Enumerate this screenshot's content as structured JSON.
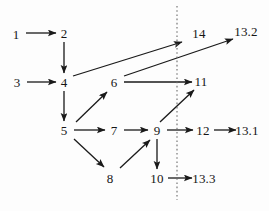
{
  "diagram": {
    "type": "directed-graph",
    "title": "",
    "canvas": {
      "width": 269,
      "height": 211,
      "background": "#fdfdfd"
    },
    "style": {
      "edge_color": "#1a1a1a",
      "edge_width": 1.3,
      "label_color": "#151515",
      "label_font_size": 13,
      "divider_color": "#6b6b6b"
    },
    "divider": {
      "name": "vertical-dotted-divider",
      "orientation": "vertical",
      "x": 177,
      "y1": 6,
      "y2": 200,
      "dash": "1.6,2.6"
    },
    "nodes": [
      {
        "id": "1",
        "label": "1",
        "x": 16,
        "y": 34
      },
      {
        "id": "2",
        "label": "2",
        "x": 64,
        "y": 33
      },
      {
        "id": "3",
        "label": "3",
        "x": 17,
        "y": 82
      },
      {
        "id": "4",
        "label": "4",
        "x": 64,
        "y": 82
      },
      {
        "id": "5",
        "label": "5",
        "x": 64,
        "y": 130
      },
      {
        "id": "6",
        "label": "6",
        "x": 114,
        "y": 82
      },
      {
        "id": "7",
        "label": "7",
        "x": 114,
        "y": 130
      },
      {
        "id": "8",
        "label": "8",
        "x": 110,
        "y": 178
      },
      {
        "id": "9",
        "label": "9",
        "x": 157,
        "y": 130
      },
      {
        "id": "10",
        "label": "10",
        "x": 157,
        "y": 178
      },
      {
        "id": "11",
        "label": "11",
        "x": 201,
        "y": 81
      },
      {
        "id": "12",
        "label": "12",
        "x": 203,
        "y": 130
      },
      {
        "id": "14",
        "label": "14",
        "x": 199,
        "y": 33
      },
      {
        "id": "13.1",
        "label": "13.1",
        "x": 247,
        "y": 130
      },
      {
        "id": "13.2",
        "label": "13.2",
        "x": 246,
        "y": 31
      },
      {
        "id": "13.3",
        "label": "13.3",
        "x": 204,
        "y": 178
      }
    ],
    "edges": [
      {
        "from": "1",
        "to": "2",
        "x1": 26,
        "y1": 33,
        "x2": 56,
        "y2": 33
      },
      {
        "from": "2",
        "to": "4",
        "x1": 64,
        "y1": 42,
        "x2": 64,
        "y2": 73
      },
      {
        "from": "3",
        "to": "4",
        "x1": 27,
        "y1": 82,
        "x2": 56,
        "y2": 82
      },
      {
        "from": "4",
        "to": "14",
        "x1": 73,
        "y1": 76,
        "x2": 182,
        "y2": 42
      },
      {
        "from": "4",
        "to": "5",
        "x1": 64,
        "y1": 91,
        "x2": 64,
        "y2": 121
      },
      {
        "from": "5",
        "to": "6",
        "x1": 76,
        "y1": 122,
        "x2": 107,
        "y2": 92
      },
      {
        "from": "5",
        "to": "7",
        "x1": 74,
        "y1": 130,
        "x2": 105,
        "y2": 130
      },
      {
        "from": "5",
        "to": "8",
        "x1": 74,
        "y1": 139,
        "x2": 104,
        "y2": 167
      },
      {
        "from": "6",
        "to": "11",
        "x1": 124,
        "y1": 82,
        "x2": 192,
        "y2": 82
      },
      {
        "from": "6",
        "to": "13.2",
        "x1": 124,
        "y1": 76,
        "x2": 233,
        "y2": 39
      },
      {
        "from": "7",
        "to": "9",
        "x1": 124,
        "y1": 130,
        "x2": 148,
        "y2": 130
      },
      {
        "from": "8",
        "to": "9",
        "x1": 120,
        "y1": 168,
        "x2": 150,
        "y2": 140
      },
      {
        "from": "9",
        "to": "11",
        "x1": 160,
        "y1": 122,
        "x2": 194,
        "y2": 90
      },
      {
        "from": "9",
        "to": "12",
        "x1": 167,
        "y1": 130,
        "x2": 193,
        "y2": 130
      },
      {
        "from": "9",
        "to": "10",
        "x1": 157,
        "y1": 139,
        "x2": 157,
        "y2": 169
      },
      {
        "from": "10",
        "to": "13.3",
        "x1": 168,
        "y1": 178,
        "x2": 192,
        "y2": 178
      },
      {
        "from": "12",
        "to": "13.1",
        "x1": 214,
        "y1": 130,
        "x2": 236,
        "y2": 130
      }
    ]
  }
}
